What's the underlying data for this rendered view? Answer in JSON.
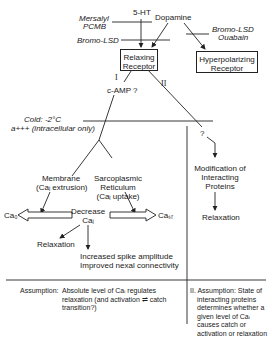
{
  "inputs": {
    "serotonin": "5-HT",
    "dopamine": "Dopamine",
    "mersalyl": "Mersalyl",
    "pcmb": "PCMB",
    "bromo_lsd_left": "Bromo-LSD",
    "bromo_lsd_right": "Bromo-LSD",
    "ouabain": "Ouabain"
  },
  "receptors": {
    "relaxing": [
      "Relaxing",
      "Receptor"
    ],
    "hyperpolarizing": [
      "Hyperpolarizing",
      "Receptor"
    ]
  },
  "pathways": {
    "path1_label": "I",
    "path2_label": "II",
    "camp": "c-AMP ?",
    "question": "?"
  },
  "inhibitors": {
    "cold": "Cold: -2°C",
    "atp": "a+++ (intracellular only)"
  },
  "branches": {
    "membrane": [
      "Membrane",
      "(Caᵢ extrusion)"
    ],
    "sr": [
      "Sarcoplasmic",
      "Reticulum",
      "(Caᵢ uptake)"
    ]
  },
  "outcomes": {
    "cao": "Ca₀",
    "casr": "Caₛᵣ",
    "decrease": [
      "Decrease",
      "Caᵢ"
    ],
    "relaxation_left": "Relaxation",
    "spike": [
      "Increased spike amplitude",
      "Improved nexal connectivity"
    ],
    "modification": [
      "Modification of",
      "Interacting",
      "Proteins"
    ],
    "relaxation_right": "Relaxation"
  },
  "assumptions": {
    "left_label": "Assumption:",
    "left_text": [
      "Absolute level of Caᵢ regulates",
      "relaxation (and activation ⇌ catch",
      "transition?)"
    ],
    "right_text": [
      "II. Assumption: State of",
      "interacting proteins",
      "determines whether a",
      "given level of Caᵢ",
      "causes catch or",
      "activation or relaxation"
    ]
  }
}
